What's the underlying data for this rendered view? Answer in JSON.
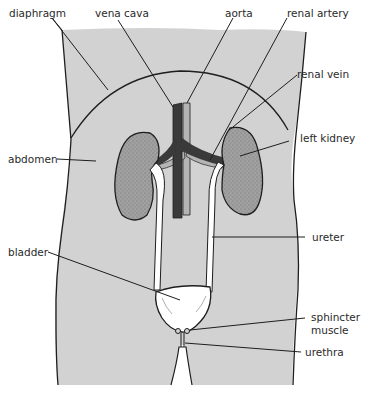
{
  "diagram": {
    "labels": {
      "diaphragm": "diaphragm",
      "vena_cava": "vena cava",
      "aorta": "aorta",
      "renal_artery": "renal artery",
      "renal_vein": "renal vein",
      "left_kidney": "left kidney",
      "abdomen": "abdomen",
      "ureter": "ureter",
      "bladder": "bladder",
      "sphincter_muscle_line1": "sphincter",
      "sphincter_muscle_line2": "muscle",
      "urethra": "urethra"
    },
    "colors": {
      "body_fill": "#d2d2d2",
      "outline": "#1e1e1e",
      "kidney_fill": "#9a9a9a",
      "vena_cava": "#3a3a3a",
      "aorta": "#b4b4b4",
      "ureter": "#ffffff",
      "bladder": "#ffffff",
      "background": "#ffffff"
    }
  }
}
